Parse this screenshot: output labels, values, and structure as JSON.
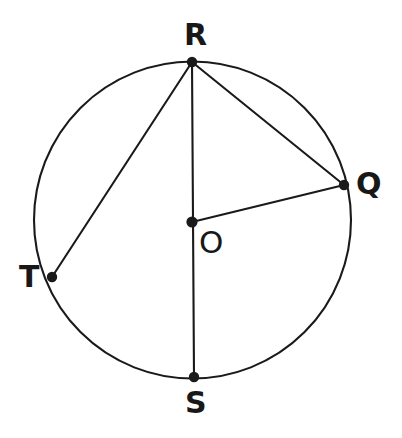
{
  "figure": {
    "background_color": "#ffffff",
    "stroke_color": "#1a1a1a",
    "stroke_width": 2.1,
    "text_color": "#181818"
  },
  "circle": {
    "name": "circle-O",
    "center_x": 192.5,
    "center_y": 220,
    "radius": 158.5
  },
  "points": {
    "R": {
      "label": "R",
      "x": 192,
      "y": 62,
      "label_x": 184,
      "label_y": 20,
      "dot_radius": 5.2
    },
    "Q": {
      "label": "Q",
      "x": 344,
      "y": 185,
      "label_x": 356,
      "label_y": 169,
      "dot_radius": 5.2
    },
    "T": {
      "label": "T",
      "x": 52,
      "y": 277,
      "label_x": 19,
      "label_y": 262,
      "dot_radius": 5.2
    },
    "S": {
      "label": "S",
      "x": 194,
      "y": 377,
      "label_x": 185,
      "label_y": 388,
      "dot_radius": 5.2
    },
    "O": {
      "label": "O",
      "x": 192,
      "y": 222,
      "label_x": 199,
      "label_y": 227,
      "dot_radius": 5.6
    }
  },
  "segments": [
    {
      "name": "segment-RS",
      "from": "R",
      "to": "S",
      "x1": 192,
      "y1": 62,
      "x2": 194,
      "y2": 377,
      "kind": "diameter"
    },
    {
      "name": "segment-RT",
      "from": "R",
      "to": "T",
      "x1": 192,
      "y1": 62,
      "x2": 52,
      "y2": 277,
      "kind": "chord"
    },
    {
      "name": "segment-RQ",
      "from": "R",
      "to": "Q",
      "x1": 192,
      "y1": 62,
      "x2": 344,
      "y2": 185,
      "kind": "chord"
    },
    {
      "name": "segment-OQ",
      "from": "O",
      "to": "Q",
      "x1": 192,
      "y1": 222,
      "x2": 344,
      "y2": 185,
      "kind": "radius"
    }
  ]
}
